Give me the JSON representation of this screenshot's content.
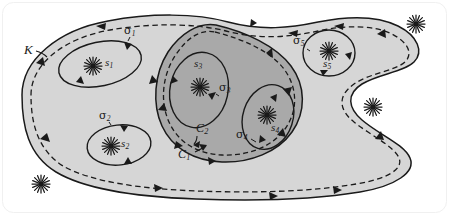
{
  "figure": {
    "type": "math-diagram",
    "width": 449,
    "height": 215,
    "background": "#ffffff",
    "colors": {
      "outer_region_fill": "#d6d6d6",
      "inner_region_fill": "#a9a9a9",
      "stroke": "#1a1a1a",
      "label": "#1a1a1a",
      "page": "#ffffff"
    }
  },
  "labels": {
    "region_K": "K",
    "contour_C1": "C",
    "contour_C1_sub": "1",
    "contour_C2": "C",
    "contour_C2_sub": "2",
    "sigma": "σ",
    "s": "s",
    "sigma1_sub": "1",
    "sigma2_sub": "2",
    "sigma3_sub": "3",
    "sigma4_sub": "4",
    "sigma5_sub": "5",
    "s1_sub": "1",
    "s2_sub": "2",
    "s3_sub": "3",
    "s4_sub": "4",
    "s5_sub": "5"
  },
  "singularities": [
    {
      "name": "s1",
      "label_base": "s",
      "label_sub": "1",
      "x": 93,
      "y": 66,
      "inside": "outer-region",
      "loop": "sigma1"
    },
    {
      "name": "s2",
      "label_base": "s",
      "label_sub": "2",
      "x": 111,
      "y": 146,
      "inside": "outer-region",
      "loop": "sigma2"
    },
    {
      "name": "s3",
      "label_base": "s",
      "label_sub": "3",
      "x": 200,
      "y": 87,
      "inside": "inner-region",
      "loop": "sigma3"
    },
    {
      "name": "s4",
      "label_base": "s",
      "label_sub": "4",
      "x": 267,
      "y": 115,
      "inside": "inner-region",
      "loop": "sigma4"
    },
    {
      "name": "s5",
      "label_base": "s",
      "label_sub": "5",
      "x": 329,
      "y": 51,
      "inside": "outer-region",
      "loop": "sigma5"
    },
    {
      "name": "exterior-star-top-right",
      "label_base": "",
      "label_sub": "",
      "x": 416,
      "y": 24,
      "inside": "exterior",
      "loop": null
    },
    {
      "name": "exterior-star-right",
      "label_base": "",
      "label_sub": "",
      "x": 373,
      "y": 107,
      "inside": "exterior",
      "loop": null
    },
    {
      "name": "exterior-star-bottom-left",
      "label_base": "",
      "label_sub": "",
      "x": 41,
      "y": 184,
      "inside": "exterior",
      "loop": null
    }
  ],
  "loops": [
    {
      "name": "sigma1",
      "label_base": "σ",
      "label_sub": "1",
      "around": "s1",
      "orientation": "counterclockwise"
    },
    {
      "name": "sigma2",
      "label_base": "σ",
      "label_sub": "2",
      "around": "s2",
      "orientation": "counterclockwise"
    },
    {
      "name": "sigma3",
      "label_base": "σ",
      "label_sub": "3",
      "around": "s3",
      "orientation": "counterclockwise"
    },
    {
      "name": "sigma4",
      "label_base": "σ",
      "label_sub": "4",
      "around": "s4",
      "orientation": "counterclockwise"
    },
    {
      "name": "sigma5",
      "label_base": "σ",
      "label_sub": "5",
      "around": "s5",
      "orientation": "counterclockwise"
    }
  ],
  "contours": [
    {
      "name": "C1",
      "style": "dashed",
      "label_base": "C",
      "label_sub": "1",
      "encloses": "outer-region-boundary"
    },
    {
      "name": "C2",
      "style": "dashed",
      "label_base": "C",
      "label_sub": "2",
      "encloses": "inner-region-boundary"
    }
  ],
  "label_positions": {
    "K": {
      "x": 24,
      "y": 50,
      "size": 13
    },
    "sigma1": {
      "x": 124,
      "y": 32,
      "size": 11
    },
    "sigma2": {
      "x": 101,
      "y": 117,
      "size": 11
    },
    "sigma3": {
      "x": 219,
      "y": 88,
      "size": 11
    },
    "sigma4": {
      "x": 238,
      "y": 135,
      "size": 11
    },
    "sigma5": {
      "x": 295,
      "y": 42,
      "size": 11
    },
    "s1": {
      "x": 105,
      "y": 60,
      "size": 11
    },
    "s2": {
      "x": 121,
      "y": 141,
      "size": 11
    },
    "s3": {
      "x": 194,
      "y": 62,
      "size": 11
    },
    "s4": {
      "x": 272,
      "y": 126,
      "size": 11
    },
    "s5": {
      "x": 323,
      "y": 62,
      "size": 11
    },
    "C1": {
      "x": 179,
      "y": 155,
      "size": 12
    },
    "C2": {
      "x": 198,
      "y": 129,
      "size": 12
    }
  }
}
